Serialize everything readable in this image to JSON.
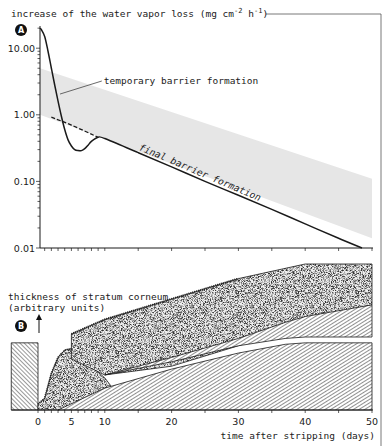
{
  "chart_data": [
    {
      "panel": "A",
      "type": "line",
      "title": "increase of the water vapor loss (mg cm-2 h-1)",
      "title_parts": {
        "main": "increase of the water vapor loss (mg cm",
        "sup1": "-2",
        "mid": " h",
        "sup2": "-1",
        "end": ")"
      },
      "xlabel": "time after stripping (days)",
      "ylabel": "increase of the water vapor loss (mg cm-2 h-1)",
      "yscale": "log",
      "ylim": [
        0.01,
        25
      ],
      "xlim": [
        0,
        50
      ],
      "ytick_labels": [
        "10.00",
        "1.00",
        "0.10",
        "0.01"
      ],
      "ytick_values": [
        10,
        1,
        0.1,
        0.01
      ],
      "grid": false,
      "series": [
        {
          "name": "water vapor loss",
          "style": "solid",
          "x": [
            0,
            0.5,
            1,
            1.5,
            2,
            2.5,
            3,
            3.5,
            4,
            4.5,
            5,
            5.5,
            6,
            6.5,
            7,
            7.5,
            8,
            9,
            10,
            15,
            20,
            25,
            30,
            35,
            40,
            45,
            48.5
          ],
          "y": [
            20,
            19,
            15,
            9,
            5,
            2.8,
            1.6,
            0.95,
            0.6,
            0.42,
            0.34,
            0.3,
            0.29,
            0.29,
            0.31,
            0.35,
            0.4,
            0.46,
            0.44,
            0.27,
            0.165,
            0.1,
            0.062,
            0.038,
            0.023,
            0.014,
            0.01
          ]
        },
        {
          "name": "final barrier formation extrapolation",
          "style": "dashed",
          "x": [
            2,
            5,
            9
          ],
          "y": [
            0.92,
            0.7,
            0.46
          ]
        }
      ],
      "band": {
        "name": "temporary barrier formation range",
        "x": [
          0,
          50
        ],
        "upper": [
          5.0,
          0.11
        ],
        "lower": [
          1.0,
          0.014
        ]
      },
      "annotations": [
        {
          "text": "temporary barrier formation",
          "x": 10,
          "y": 2.9
        },
        {
          "text": "final barrier formation",
          "x": 25,
          "y": 0.25,
          "rotated": true
        }
      ],
      "panel_label": "A"
    },
    {
      "panel": "B",
      "type": "area",
      "ylabel": "thickness of stratum corneum",
      "ylabel_unit": "(arbitrary units)",
      "xlabel": "time after stripping (days)",
      "xlim": [
        -4,
        50
      ],
      "xtick_labels": [
        "0",
        "5",
        "10",
        "20",
        "30",
        "40",
        "50"
      ],
      "xtick_values": [
        0,
        5,
        10,
        20,
        30,
        40,
        50
      ],
      "yunits": "arbitrary (0-10)",
      "ylim": [
        0,
        10
      ],
      "layers": [
        {
          "name": "intact stratum corneum before stripping",
          "pattern": "hatched",
          "x": [
            -4,
            0
          ],
          "bottom": [
            0,
            0
          ],
          "top": [
            4.6,
            4.6
          ]
        },
        {
          "name": "temporary barrier layer",
          "pattern": "stippled",
          "x": [
            0,
            1,
            2,
            3,
            4,
            5,
            6,
            8,
            10,
            11
          ],
          "bottom": [
            0,
            0,
            0,
            0,
            0.1,
            0.3,
            0.5,
            0.9,
            1.3,
            1.5
          ],
          "top": [
            0.4,
            0.8,
            2.5,
            3.6,
            4.1,
            4.2,
            3.8,
            3.0,
            2.2,
            1.6
          ]
        },
        {
          "name": "desquamating outer layer",
          "pattern": "stippled",
          "x": [
            5,
            10,
            20,
            30,
            40,
            50
          ],
          "bottom": [
            3.5,
            2.4,
            3.0,
            4.4,
            5.8,
            7.2
          ],
          "top": [
            5.2,
            6.2,
            7.6,
            9.0,
            10.0,
            10.0
          ]
        },
        {
          "name": "upper newly formed hatched layer",
          "pattern": "hatched",
          "x": [
            10,
            20,
            30,
            37,
            40,
            50
          ],
          "bottom": [
            2.4,
            3.3,
            4.4,
            4.9,
            5.0,
            5.0
          ],
          "top": [
            2.4,
            3.6,
            4.9,
            6.0,
            6.4,
            7.2
          ]
        },
        {
          "name": "lower newly formed hatched layer",
          "pattern": "hatched",
          "x": [
            3,
            10,
            20,
            30,
            37,
            40,
            50
          ],
          "bottom": [
            0,
            0,
            0,
            0,
            0,
            0,
            0
          ],
          "top": [
            0,
            1.5,
            2.8,
            3.9,
            4.5,
            4.6,
            4.6
          ]
        }
      ],
      "panel_label": "B"
    }
  ],
  "labels": {
    "panel_a_badge": "A",
    "panel_b_badge": "B",
    "yaxis_a_title_main": "increase of the water vapor loss (mg cm",
    "yaxis_a_sup1": "-2",
    "yaxis_a_mid": " h",
    "yaxis_a_sup2": "-1",
    "yaxis_a_end": ")",
    "temporary_annotation": "temporary barrier formation",
    "final_annotation": "final barrier formation",
    "yaxis_b_title": "thickness of stratum corneum",
    "yaxis_b_unit": "(arbitrary units)",
    "xaxis_title": "time after stripping (days)"
  },
  "colors": {
    "ink": "#1a1a1a",
    "band": "#e6e6e6",
    "stipple_bg": "#d2d2d2",
    "frame": "#555555"
  }
}
